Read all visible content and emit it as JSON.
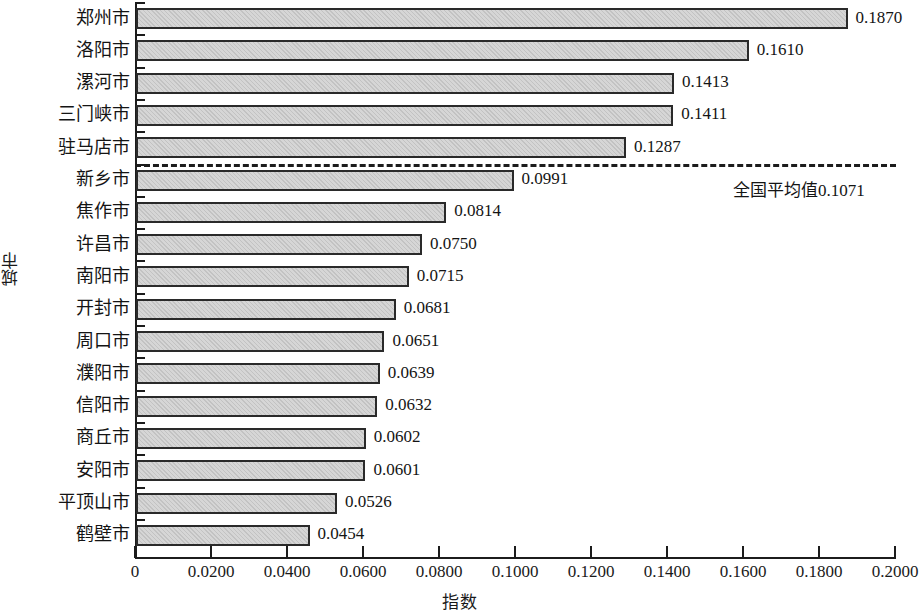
{
  "chart_data": {
    "type": "bar",
    "orientation": "horizontal",
    "title": "",
    "xlabel": "指数",
    "ylabel": "城市",
    "xlim": [
      0,
      0.2
    ],
    "grid": false,
    "legend": null,
    "xticks": [
      "0",
      "0.0200",
      "0.0400",
      "0.0600",
      "0.0800",
      "0.1000",
      "0.1200",
      "0.1400",
      "0.1600",
      "0.1800",
      "0.2000"
    ],
    "xtick_values": [
      0,
      0.02,
      0.04,
      0.06,
      0.08,
      0.1,
      0.12,
      0.14,
      0.16,
      0.18,
      0.2
    ],
    "categories": [
      "郑州市",
      "洛阳市",
      "漯河市",
      "三门峡市",
      "驻马店市",
      "新乡市",
      "焦作市",
      "许昌市",
      "南阳市",
      "开封市",
      "周口市",
      "濮阳市",
      "信阳市",
      "商丘市",
      "安阳市",
      "平顶山市",
      "鹤壁市"
    ],
    "values": [
      0.187,
      0.161,
      0.1413,
      0.1411,
      0.1287,
      0.0991,
      0.0814,
      0.075,
      0.0715,
      0.0681,
      0.0651,
      0.0639,
      0.0632,
      0.0602,
      0.0601,
      0.0526,
      0.0454
    ],
    "value_labels": [
      "0.1870",
      "0.1610",
      "0.1413",
      "0.1411",
      "0.1287",
      "0.0991",
      "0.0814",
      "0.0750",
      "0.0715",
      "0.0681",
      "0.0651",
      "0.0639",
      "0.0632",
      "0.0602",
      "0.0601",
      "0.0526",
      "0.0454"
    ],
    "annotations": [
      {
        "name": "national-average",
        "label": "全国平均值0.1071",
        "value": 0.1071,
        "style": "dashed-horizontal-reference-line",
        "after_category_index": 4
      }
    ],
    "colors": {
      "bar_fill": "#d6d6d6",
      "bar_edge": "#2a2a2a",
      "axis": "#1c1c1c",
      "text": "#141414"
    }
  }
}
